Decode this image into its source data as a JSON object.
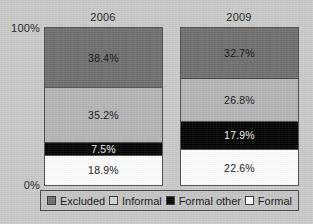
{
  "chart_data": {
    "type": "bar",
    "subtype": "stacked-percentage",
    "title": "",
    "xlabel": "",
    "ylabel": "",
    "categories": [
      "2006",
      "2009"
    ],
    "ylim": [
      0,
      100
    ],
    "ytick_labels": [
      "100%",
      "0%"
    ],
    "grid": false,
    "legend_position": "bottom",
    "stack_order_bottom_to_top": [
      "Formal",
      "Formal other",
      "Informal",
      "Excluded"
    ],
    "series": [
      {
        "name": "Excluded",
        "color": "#6e6e6e",
        "values": [
          38.4,
          32.7
        ],
        "labels": [
          "38.4%",
          "32.7%"
        ]
      },
      {
        "name": "Informal",
        "color": "#b4b4b4",
        "values": [
          35.2,
          26.8
        ],
        "labels": [
          "35.2%",
          "26.8%"
        ]
      },
      {
        "name": "Formal other",
        "color": "#000000",
        "values": [
          7.5,
          17.9
        ],
        "labels": [
          "7.5%",
          "17.9%"
        ]
      },
      {
        "name": "Formal",
        "color": "#fdfdfd",
        "values": [
          18.9,
          22.6
        ],
        "labels": [
          "18.9%",
          "22.6%"
        ]
      }
    ]
  },
  "axis": {
    "top_label": "100%",
    "bottom_label": "0%"
  },
  "bars": {
    "b2006": {
      "year": "2006",
      "segments": [
        {
          "label": "38.4%",
          "pct": 38.4
        },
        {
          "label": "35.2%",
          "pct": 35.2
        },
        {
          "label": "7.5%",
          "pct": 7.5
        },
        {
          "label": "18.9%",
          "pct": 18.9
        }
      ]
    },
    "b2009": {
      "year": "2009",
      "segments": [
        {
          "label": "32.7%",
          "pct": 32.7
        },
        {
          "label": "26.8%",
          "pct": 26.8
        },
        {
          "label": "17.9%",
          "pct": 17.9
        },
        {
          "label": "22.6%",
          "pct": 22.6
        }
      ]
    }
  },
  "legend": {
    "items": [
      {
        "label": "Excluded",
        "color": "#6e6e6e"
      },
      {
        "label": "Informal",
        "color": "#d2d2d2"
      },
      {
        "label": "Formal other",
        "color": "#000000"
      },
      {
        "label": "Formal",
        "color": "#fdfdfd"
      }
    ]
  },
  "colors": {
    "background": "#c9c9c9",
    "frame": "#4a4a4a",
    "excluded": "#6e6e6e",
    "informal": "#b4b4b4",
    "formal_other": "#000000",
    "formal": "#fdfdfd"
  }
}
